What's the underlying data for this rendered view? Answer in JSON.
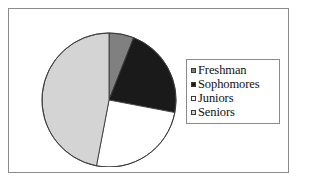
{
  "frame": {
    "border_color": "#8b8b8b",
    "background": "#ffffff"
  },
  "legend": {
    "position": "right",
    "border_color": "#8b8b8b",
    "items": [
      {
        "label": "Freshman",
        "color": "#808080",
        "swatch_icon": "square-swatch-icon"
      },
      {
        "label": "Sophomores",
        "color": "#1a1a1a",
        "swatch_icon": "square-swatch-icon"
      },
      {
        "label": "Juniors",
        "color": "#ffffff",
        "swatch_icon": "square-swatch-icon"
      },
      {
        "label": "Seniors",
        "color": "#d4d4d4",
        "swatch_icon": "square-swatch-icon"
      }
    ]
  },
  "chart_data": {
    "type": "pie",
    "title": "",
    "subtitle": "",
    "xlabel": "",
    "ylabel": "",
    "grid": false,
    "legend_position": "right",
    "start_angle": 0,
    "direction": "clockwise",
    "categories": [
      "Freshman",
      "Sophomores",
      "Juniors",
      "Seniors"
    ],
    "values": [
      6,
      22,
      25,
      47
    ],
    "value_unit": "percent",
    "colors": [
      "#808080",
      "#1a1a1a",
      "#ffffff",
      "#d4d4d4"
    ],
    "slice_outline_color": "#3a3a3a",
    "slices": [
      {
        "label": "Freshman",
        "value": 6,
        "color": "#808080",
        "start_deg": 0,
        "end_deg": 21.6
      },
      {
        "label": "Sophomores",
        "value": 22,
        "color": "#1a1a1a",
        "start_deg": 21.6,
        "end_deg": 100.8
      },
      {
        "label": "Juniors",
        "value": 25,
        "color": "#ffffff",
        "start_deg": 100.8,
        "end_deg": 190.8
      },
      {
        "label": "Seniors",
        "value": 47,
        "color": "#d4d4d4",
        "start_deg": 190.8,
        "end_deg": 360
      }
    ],
    "geometry": {
      "center_x": 74,
      "center_y": 83,
      "radius": 67
    }
  }
}
